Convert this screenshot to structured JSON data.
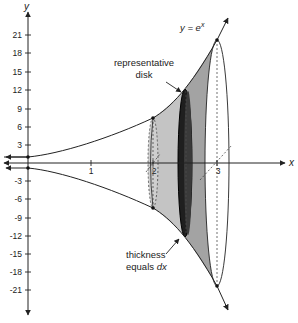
{
  "diagram": {
    "curve_label": "y = e",
    "curve_label_exp": "x",
    "axes": {
      "x_label": "x",
      "y_label": "y",
      "x_ticks": [
        "1",
        "2",
        "3"
      ],
      "y_ticks_positive": [
        "21",
        "18",
        "15",
        "12",
        "9",
        "6",
        "3"
      ],
      "y_ticks_negative": [
        "-3",
        "-6",
        "-9",
        "-12",
        "-15",
        "-18",
        "-21"
      ]
    },
    "annotations": {
      "disk_line1": "representative",
      "disk_line2": "disk",
      "thickness_line1": "thickness",
      "thickness_line2": "equals ",
      "thickness_dx": "dx"
    },
    "colors": {
      "solid_light": "#bdbdbd",
      "solid_mid": "#9a9a9a",
      "disk": "#2b2b2b",
      "line": "#222222"
    }
  }
}
